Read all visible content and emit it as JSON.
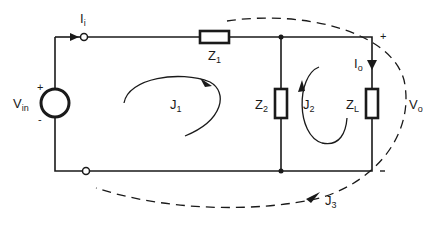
{
  "diagram": {
    "type": "circuit-schematic",
    "colors": {
      "line": "#1a1a1a",
      "background": "#ffffff"
    },
    "source": {
      "label": "V",
      "sub": "in",
      "plus": "+",
      "minus": "-"
    },
    "input_current": {
      "label": "I",
      "sub": "i"
    },
    "output_current": {
      "label": "I",
      "sub": "o"
    },
    "output_voltage": {
      "label": "V",
      "sub": "o",
      "plus": "+",
      "minus": "-"
    },
    "impedances": [
      {
        "id": "z1",
        "label": "Z",
        "sub": "1"
      },
      {
        "id": "z2",
        "label": "Z",
        "sub": "2"
      },
      {
        "id": "zl",
        "label": "Z",
        "sub": "L"
      }
    ],
    "loops": [
      {
        "id": "j1",
        "label": "J",
        "sub": "1"
      },
      {
        "id": "j2",
        "label": "J",
        "sub": "2"
      },
      {
        "id": "j3",
        "label": "J",
        "sub": "3"
      }
    ]
  }
}
